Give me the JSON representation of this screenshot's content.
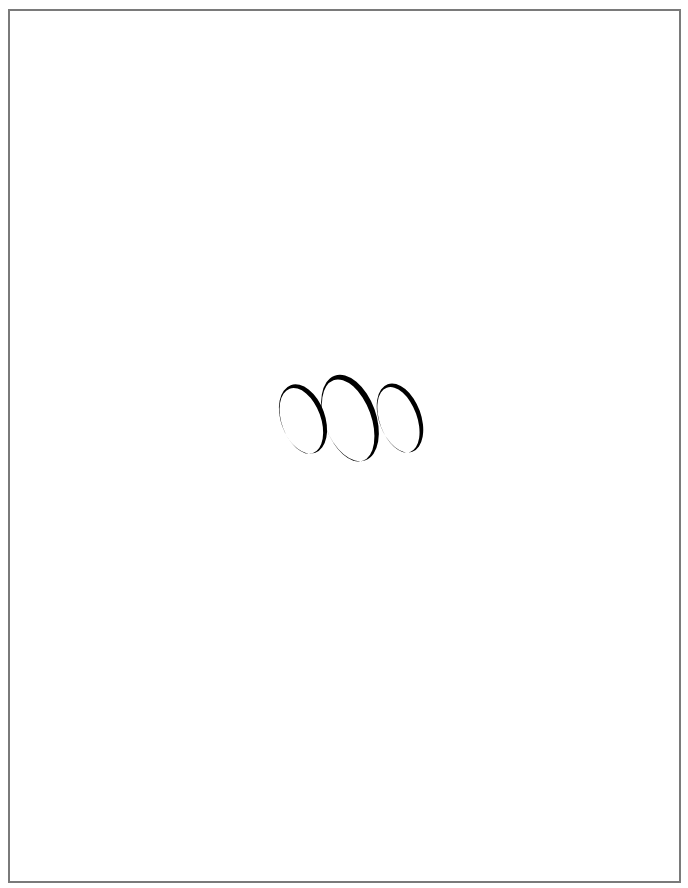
{
  "page": {
    "background": "#ffffff",
    "border_color": "#7a7a7a"
  },
  "graphic": {
    "description": "three tilted crescent rings",
    "ink_color": "#000000",
    "rings": [
      {
        "name": "left-ring",
        "cx": 33,
        "cy": 54,
        "rx": 22,
        "ry": 36,
        "rotate": -20
      },
      {
        "name": "middle-ring",
        "cx": 80,
        "cy": 53,
        "rx": 26,
        "ry": 45,
        "rotate": -20
      },
      {
        "name": "right-ring",
        "cx": 130,
        "cy": 53,
        "rx": 21,
        "ry": 36,
        "rotate": -20
      }
    ]
  }
}
